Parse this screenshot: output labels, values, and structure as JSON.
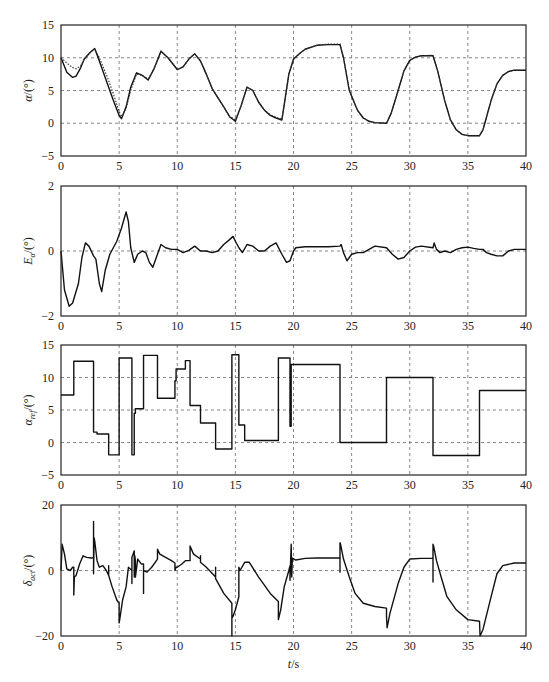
{
  "chart_data": [
    {
      "type": "line",
      "id": "alpha",
      "ylabel": "α/(°)",
      "ylabel_main": "α",
      "ylabel_unit": "/(°)",
      "xlabel": "",
      "xlim": [
        0,
        40
      ],
      "ylim": [
        -5,
        15
      ],
      "yticks": [
        -5,
        0,
        5,
        10,
        15
      ],
      "xticks": [
        0,
        5,
        10,
        15,
        20,
        25,
        30,
        35,
        40
      ],
      "grid": true,
      "series": [
        {
          "name": "actual",
          "style": "solid",
          "x": [
            0,
            0.5,
            1,
            1.3,
            1.7,
            2,
            2.5,
            2.9,
            3.3,
            4,
            4.5,
            5,
            5.2,
            5.6,
            6,
            6.5,
            7,
            7.5,
            8,
            8.6,
            9.2,
            10,
            10.5,
            11,
            11.5,
            12,
            12.5,
            13,
            14,
            14.5,
            15,
            15.5,
            16,
            16.5,
            17,
            17.5,
            18,
            18.5,
            19,
            19.3,
            19.6,
            20,
            20.5,
            21,
            22,
            23,
            24,
            24.3,
            24.8,
            25.5,
            26,
            26.5,
            27,
            28,
            28.4,
            29,
            29.5,
            30,
            30.5,
            31,
            32,
            32.4,
            33,
            33.5,
            34,
            34.5,
            35,
            36,
            36.3,
            37,
            37.5,
            38,
            38.5,
            39,
            40
          ],
          "y": [
            10,
            7.8,
            7,
            7.2,
            8.5,
            9.8,
            10.8,
            11.4,
            9.5,
            6,
            3.5,
            1.2,
            0.7,
            2.5,
            5.5,
            7.7,
            7.3,
            6.6,
            8.3,
            11,
            10,
            8.2,
            8.6,
            9.8,
            10.6,
            9.5,
            7.5,
            5.3,
            2.5,
            1,
            0.3,
            2.7,
            5.5,
            5,
            3.2,
            2,
            1.2,
            0.8,
            0.5,
            4,
            7.5,
            9.8,
            10.6,
            11.3,
            11.9,
            12,
            12,
            10,
            5,
            2,
            0.8,
            0.3,
            0.1,
            0,
            1.5,
            5,
            8,
            9.6,
            10.1,
            10.3,
            10.3,
            8,
            3.5,
            0.5,
            -1,
            -1.7,
            -1.9,
            -1.9,
            -1,
            3.5,
            6,
            7.3,
            7.9,
            8.1,
            8.1
          ]
        },
        {
          "name": "reference",
          "style": "dotted",
          "x": [
            0,
            0.5,
            1,
            1.3,
            1.7,
            2,
            2.5,
            2.9,
            3.3,
            4,
            4.5,
            5,
            5.2,
            5.6,
            6,
            6.5,
            7,
            7.5,
            8,
            8.6,
            9.2,
            10,
            10.5,
            11,
            11.5,
            12,
            12.5,
            13,
            14,
            14.5,
            15,
            15.5,
            16,
            16.5,
            17,
            17.5,
            18,
            18.5,
            19,
            19.3,
            19.6,
            20,
            20.5,
            21,
            22,
            23,
            24,
            24.3,
            24.8,
            25.5,
            26,
            26.5,
            27,
            28,
            28.4,
            29,
            29.5,
            30,
            30.5,
            31,
            32,
            32.4,
            33,
            33.5,
            34,
            34.5,
            35,
            36,
            36.3,
            37,
            37.5,
            38,
            38.5,
            39,
            40
          ],
          "y": [
            10,
            9.2,
            8.5,
            8.3,
            8.8,
            9.8,
            10.8,
            11.3,
            10,
            7,
            4.5,
            1.8,
            1,
            2.3,
            5,
            7.5,
            7.3,
            6.8,
            8.3,
            11,
            10,
            8.2,
            8.6,
            9.8,
            10.6,
            9.5,
            7.5,
            5.3,
            2.5,
            1.1,
            0.5,
            2.7,
            5.5,
            5,
            3.2,
            2,
            1.3,
            0.9,
            0.6,
            3.8,
            7.5,
            9.7,
            10.6,
            11.3,
            11.9,
            12.1,
            12.1,
            10,
            5,
            2,
            0.8,
            0.3,
            0.1,
            0,
            1.5,
            5,
            8,
            9.6,
            10.1,
            10.3,
            10.4,
            8,
            3.5,
            0.5,
            -1,
            -1.7,
            -1.9,
            -1.9,
            -1,
            3.5,
            6,
            7.3,
            7.9,
            8.1,
            8.1
          ]
        }
      ]
    },
    {
      "type": "line",
      "id": "error",
      "ylabel": "Eα/(°)",
      "ylabel_main": "E",
      "ylabel_sub": "α",
      "ylabel_unit": "/(°)",
      "xlabel": "",
      "xlim": [
        0,
        40
      ],
      "ylim": [
        -2,
        2
      ],
      "yticks": [
        -2,
        0,
        2
      ],
      "xticks": [
        0,
        5,
        10,
        15,
        20,
        25,
        30,
        35,
        40
      ],
      "grid": true,
      "series": [
        {
          "name": "tracking error",
          "style": "solid",
          "x": [
            0,
            0.3,
            0.7,
            1,
            1.5,
            1.8,
            2.1,
            2.4,
            2.8,
            3,
            3.3,
            3.5,
            3.8,
            4.2,
            4.8,
            5.2,
            5.6,
            5.8,
            6,
            6.3,
            6.6,
            7,
            7.3,
            7.6,
            7.9,
            8.2,
            8.6,
            9,
            9.5,
            10,
            10.5,
            11,
            11.5,
            12,
            12.5,
            13,
            13.5,
            14,
            14.5,
            14.8,
            15,
            15.3,
            15.6,
            16,
            16.5,
            17,
            17.5,
            18,
            18.5,
            19,
            19.4,
            19.7,
            20,
            20.2,
            21,
            22,
            23,
            24,
            24.1,
            24.3,
            24.6,
            25,
            25.5,
            26,
            26.5,
            27,
            28,
            28.5,
            29,
            29.5,
            30,
            30.5,
            31,
            32,
            32.1,
            32.3,
            32.6,
            33,
            33.5,
            34,
            34.5,
            35,
            35.5,
            36,
            36.3,
            36.6,
            37,
            37.5,
            38,
            38.5,
            39,
            40
          ],
          "y": [
            0,
            -1.2,
            -1.7,
            -1.6,
            -1.0,
            -0.2,
            0.25,
            0.15,
            -0.15,
            -0.25,
            -1.0,
            -1.25,
            -0.6,
            -0.1,
            0.3,
            0.7,
            1.2,
            0.9,
            0.1,
            -0.35,
            -0.1,
            0.0,
            -0.05,
            -0.35,
            -0.5,
            -0.2,
            0.2,
            0.1,
            0.05,
            0.05,
            -0.05,
            0.02,
            0.15,
            0.0,
            0.0,
            -0.05,
            0.0,
            0.2,
            0.35,
            0.45,
            0.3,
            0.1,
            -0.05,
            0.2,
            0.15,
            0.0,
            0.0,
            0.15,
            0.25,
            -0.1,
            -0.35,
            -0.3,
            0.0,
            0.1,
            0.13,
            0.13,
            0.13,
            0.15,
            0.2,
            -0.05,
            -0.3,
            -0.1,
            -0.05,
            -0.05,
            0.05,
            0.15,
            0.1,
            -0.1,
            -0.25,
            -0.2,
            0.0,
            0.12,
            0.15,
            0.1,
            0.25,
            0.05,
            -0.05,
            0.0,
            -0.05,
            0.05,
            0.1,
            0.12,
            0.08,
            0.05,
            0.05,
            -0.05,
            -0.1,
            -0.15,
            -0.15,
            0.0,
            0.05,
            0.05
          ]
        }
      ]
    },
    {
      "type": "line",
      "id": "alpha_ref",
      "ylabel": "αref/(°)",
      "ylabel_main": "α",
      "ylabel_sub": "ref",
      "ylabel_unit": "/(°)",
      "xlabel": "",
      "xlim": [
        0,
        40
      ],
      "ylim": [
        -5,
        15
      ],
      "yticks": [
        -5,
        0,
        5,
        10,
        15
      ],
      "xticks": [
        0,
        5,
        10,
        15,
        20,
        25,
        30,
        35,
        40
      ],
      "grid": true,
      "series": [
        {
          "name": "reference command (step)",
          "style": "step",
          "x": [
            0,
            1.1,
            1.1,
            2.8,
            2.8,
            3.1,
            3.1,
            4.1,
            4.1,
            5.0,
            5.0,
            6.1,
            6.1,
            6.3,
            6.3,
            6.4,
            6.4,
            6.6,
            6.6,
            7.1,
            7.1,
            8.3,
            8.3,
            9.8,
            9.8,
            9.9,
            9.9,
            10.7,
            10.7,
            11.1,
            11.1,
            12.0,
            12.0,
            13.3,
            13.3,
            14.7,
            14.7,
            15.3,
            15.3,
            15.8,
            15.8,
            18.7,
            18.7,
            19.7,
            19.7,
            19.8,
            19.8,
            24.0,
            24.0,
            28.0,
            28.0,
            32.0,
            32.0,
            36.0,
            36.0,
            40
          ],
          "y": [
            7.3,
            7.3,
            12.5,
            12.5,
            1.6,
            1.6,
            1.3,
            1.3,
            -1.9,
            -1.9,
            13,
            13,
            -1.9,
            -1.9,
            4.5,
            4.5,
            5.2,
            5.2,
            5.2,
            5.2,
            13.4,
            13.4,
            6.8,
            6.8,
            9.5,
            9.5,
            11.3,
            11.3,
            12.6,
            12.6,
            5.7,
            5.7,
            3.0,
            3.0,
            -1.0,
            -1.0,
            13.5,
            13.5,
            2.7,
            2.7,
            0.3,
            0.3,
            13.0,
            13.0,
            2.5,
            2.5,
            12.0,
            12.0,
            0,
            0,
            10,
            10,
            -2,
            -2,
            8,
            8
          ]
        }
      ]
    },
    {
      "type": "line",
      "id": "delta_act",
      "ylabel": "δact/(°)",
      "ylabel_main": "δ",
      "ylabel_sub": "act",
      "ylabel_unit": "/(°)",
      "xlabel": "t/s",
      "xlim": [
        0,
        40
      ],
      "ylim": [
        -20,
        20
      ],
      "yticks": [
        -20,
        0,
        20
      ],
      "xticks": [
        0,
        5,
        10,
        15,
        20,
        25,
        30,
        35,
        40
      ],
      "grid": true,
      "series": [
        {
          "name": "actuator deflection",
          "style": "solid",
          "x": [
            0,
            0.1,
            0.3,
            0.5,
            0.8,
            1.0,
            1.1,
            1.1,
            1.15,
            1.15,
            1.3,
            1.6,
            1.9,
            2.2,
            2.6,
            2.8,
            2.8,
            2.8,
            2.85,
            2.9,
            3.1,
            3.3,
            3.6,
            3.9,
            4.1,
            4.1,
            4.1,
            4.4,
            4.8,
            5.0,
            5.0,
            5.05,
            5.3,
            5.6,
            5.8,
            6.1,
            6.1,
            6.1,
            6.2,
            6.3,
            6.3,
            6.35,
            6.4,
            6.4,
            6.6,
            6.9,
            7.1,
            7.1,
            7.1,
            7.4,
            7.8,
            8.3,
            8.3,
            8.5,
            9.0,
            9.5,
            9.8,
            9.8,
            9.9,
            10.0,
            10.4,
            10.7,
            10.7,
            11.1,
            11.1,
            11.4,
            12.0,
            12.0,
            12.0,
            12.5,
            13.3,
            13.3,
            13.3,
            14.0,
            14.7,
            14.7,
            14.7,
            14.8,
            15.0,
            15.3,
            15.3,
            15.4,
            15.8,
            15.8,
            16.2,
            17.0,
            18.0,
            18.7,
            18.7,
            18.7,
            18.9,
            19.2,
            19.6,
            19.7,
            19.7,
            19.8,
            19.8,
            19.85,
            19.9,
            20.2,
            21.0,
            22.0,
            23.0,
            24.0,
            24.0,
            24.0,
            24.05,
            24.3,
            24.8,
            25.3,
            26.0,
            27.0,
            28.0,
            28.0,
            28.0,
            28.05,
            28.3,
            29.0,
            29.5,
            30.0,
            31.0,
            32.0,
            32.0,
            32.0,
            32.05,
            32.3,
            32.7,
            33.2,
            34.0,
            35.0,
            36.0,
            36.0,
            36.05,
            36.3,
            37.0,
            37.5,
            38.0,
            39.0,
            40
          ],
          "y": [
            0,
            8,
            5,
            0.5,
            0,
            1,
            1,
            -7.5,
            -2,
            -2,
            -1.5,
            2,
            4.5,
            4,
            3.8,
            4,
            15,
            -1,
            10,
            9,
            3,
            1,
            1.5,
            0,
            -1.5,
            1.5,
            -1.5,
            -5,
            -9,
            -10,
            -16,
            -15,
            -9,
            -5,
            1,
            0,
            -4,
            4,
            5,
            6,
            -2,
            4.5,
            3,
            -2,
            3.5,
            2,
            2,
            -7,
            0,
            -0.5,
            1,
            3.5,
            6.5,
            5,
            4,
            3,
            2.3,
            0,
            1,
            1,
            2,
            3,
            3,
            3,
            7.5,
            5,
            3.5,
            4.5,
            2.5,
            1,
            -2,
            1,
            -2.5,
            -7,
            -10,
            -20,
            -14.5,
            -14,
            -12,
            -8,
            1,
            0,
            2.5,
            2.5,
            2.5,
            -2,
            -7,
            -9.5,
            -10,
            -15,
            -12,
            -5,
            0,
            1.5,
            -3,
            8,
            8,
            -2,
            3.8,
            3.2,
            3.7,
            3.8,
            3.8,
            3.8,
            -0.5,
            8.5,
            8,
            3.5,
            -2,
            -7,
            -10,
            -11,
            -11.5,
            -11.5,
            -14,
            -17.5,
            -13,
            -4,
            1,
            3.5,
            3.7,
            3.7,
            -3.5,
            8,
            7.5,
            3,
            -2,
            -8,
            -12,
            -15,
            -15.5,
            -15.5,
            -20,
            -18,
            -8,
            -1,
            1.5,
            2.3,
            2.3
          ]
        }
      ]
    }
  ]
}
